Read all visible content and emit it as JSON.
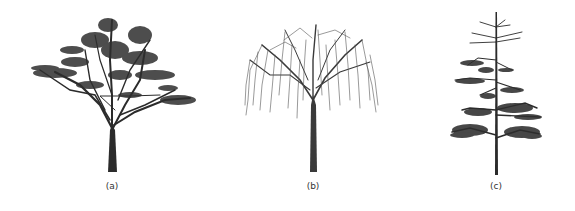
{
  "figure": {
    "panels": [
      {
        "id": "a",
        "label": "(a)",
        "subject": "broad-crowned tree with dense leafy clusters",
        "icon": "tree-broadleaf-icon"
      },
      {
        "id": "b",
        "label": "(b)",
        "subject": "weeping willow-like tree with drooping branches",
        "icon": "tree-weeping-icon"
      },
      {
        "id": "c",
        "label": "(c)",
        "subject": "conifer-like tree with tiered horizontal branches",
        "icon": "tree-conifer-icon"
      }
    ]
  },
  "colors": {
    "background": "#ffffff",
    "tree": "#2a2a2a",
    "label": "#333333"
  }
}
